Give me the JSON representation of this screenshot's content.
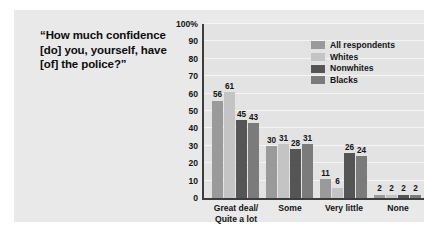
{
  "question": "“How much confidence [do] you, yourself, have [of] the police?”",
  "legend": {
    "items": [
      {
        "label": "All respondents",
        "color": "#9a9a9a"
      },
      {
        "label": "Whites",
        "color": "#c4c4c4"
      },
      {
        "label": "Nonwhites",
        "color": "#555555"
      },
      {
        "label": "Blacks",
        "color": "#7b7b7b"
      }
    ]
  },
  "chart_data": {
    "type": "bar",
    "title": "",
    "xlabel": "",
    "ylabel": "",
    "ylim": [
      0,
      100
    ],
    "yticks": [
      "0",
      "10",
      "20",
      "30",
      "40",
      "50",
      "60",
      "70",
      "80",
      "90",
      "100%"
    ],
    "ytick_values": [
      0,
      10,
      20,
      30,
      40,
      50,
      60,
      70,
      80,
      90,
      100
    ],
    "grid": true,
    "legend_position": "top-right",
    "categories": [
      "Great deal/\nQuite a lot",
      "Some",
      "Very little",
      "None"
    ],
    "category_labels": [
      [
        "Great deal/",
        "Quite a lot"
      ],
      [
        "Some"
      ],
      [
        "Very little"
      ],
      [
        "None"
      ]
    ],
    "series": [
      {
        "name": "All respondents",
        "color": "#9a9a9a",
        "values": [
          56,
          30,
          11,
          2
        ]
      },
      {
        "name": "Whites",
        "color": "#c4c4c4",
        "values": [
          61,
          31,
          6,
          2
        ]
      },
      {
        "name": "Nonwhites",
        "color": "#555555",
        "values": [
          45,
          28,
          26,
          2
        ]
      },
      {
        "name": "Blacks",
        "color": "#7b7b7b",
        "values": [
          43,
          31,
          24,
          2
        ]
      }
    ]
  }
}
